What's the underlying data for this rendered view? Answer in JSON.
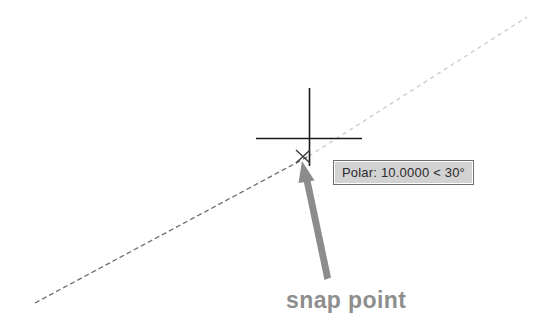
{
  "scene": {
    "title": "AutoCAD polar tracking snap point illustration",
    "background_color": "#ffffff",
    "width": 548,
    "height": 332
  },
  "tooltip": {
    "name": "polar-tracking-tooltip",
    "text": "Polar: 10.0000 < 30°",
    "distance": "10.0000",
    "angle": "30°",
    "prefix": "Polar:",
    "background_color": "#d2d2d2",
    "border_color": "#6e6e6e",
    "text_color": "#2a2a2a"
  },
  "annotation": {
    "label": "snap point",
    "color": "#8e8e8e",
    "arrow_color": "#8c8c8c"
  },
  "crosshair": {
    "name": "crosshair-cursor",
    "color": "#1a1a1a",
    "center_x": 309,
    "center_y": 138
  },
  "snap_marker": {
    "name": "snap-point-marker",
    "glyph": "x",
    "color": "#3a3a3a",
    "x": 303,
    "y": 156
  },
  "tracking_line": {
    "name": "polar-tracking-vector",
    "style": "dashed",
    "color_near": "#6b6b6b",
    "color_far": "#d8d8d8",
    "angle_degrees": 30,
    "start_x": 35,
    "start_y": 303,
    "end_x": 527,
    "end_y": 17
  }
}
